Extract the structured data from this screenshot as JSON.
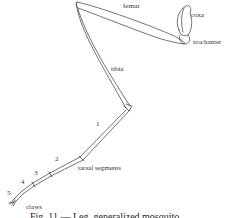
{
  "figure": {
    "caption": "Fig. 11 — Leg, generalized mosquito",
    "labels": {
      "femur": "femur",
      "coxa": "coxa",
      "trochanter": "trochanter",
      "tibia": "tibia",
      "tarsal_segments": "tarsal segments",
      "claws": "claws"
    },
    "tarsal_numbers": [
      "1",
      "2",
      "3",
      "4",
      "5"
    ],
    "colors": {
      "line": "#3a3a3a",
      "background": "#ffffff"
    }
  }
}
